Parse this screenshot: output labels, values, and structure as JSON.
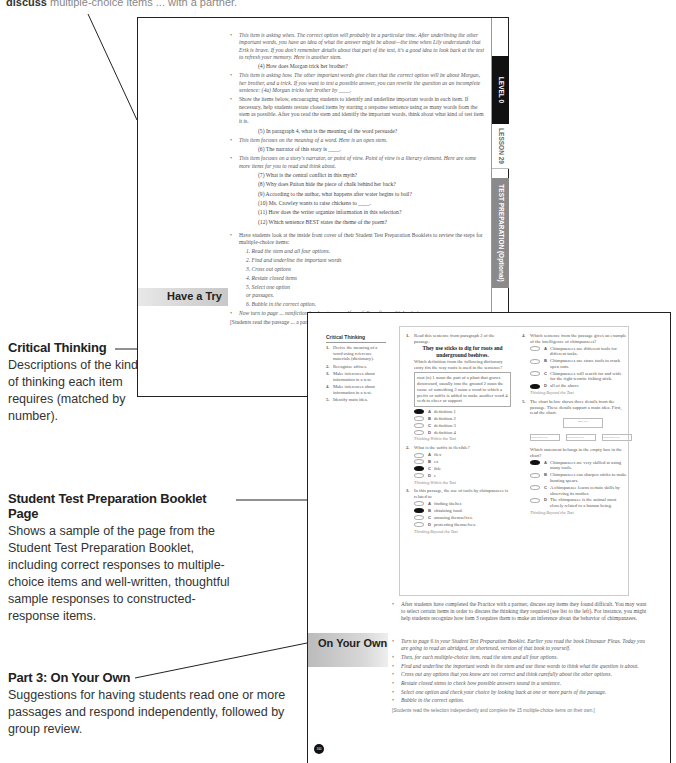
{
  "top_fragment": {
    "bold": "discuss",
    "rest": "multiple-choice items ... with a partner."
  },
  "callouts": {
    "critical_thinking": {
      "title": "Critical Thinking",
      "body": "Descriptions of the kind of thinking each item requires (matched by number)."
    },
    "booklet_page": {
      "title": "Student Test Preparation Booklet Page",
      "body": "Shows a sample of the page from the Student Test Preparation Booklet, including correct responses to multiple-choice items and well-written, thoughtful sample responses to constructed-response items."
    },
    "on_your_own": {
      "title": "Part 3: On Your Own",
      "body": "Suggestions for having students read one or more passages and respond independently, followed by group review."
    }
  },
  "back_page": {
    "tabs": {
      "level": "LEVEL  0",
      "lesson": "LESSON  29",
      "test_prep": "TEST PREPARATION (Optional)"
    },
    "section_label": "Have a Try",
    "bullet1": "This item is asking when. The correct option will probably be a particular time. After underlining the other important words, you have an idea of what the answer might be about—the time when Lily understands that Erik is brave. If you don't remember details about that part of the text, it's a good idea to look back at the text to refresh your memory. Here is another stem.",
    "stem4": "(4)  How does Morgan trick her brother?",
    "bullet2": "This item is asking how. The other important words give clues that the correct option will be about Morgan, her brother, and a trick. If you want to test a possible answer, you can rewrite the question as an incomplete sentence: (4a) Morgan tricks her brother by ____.",
    "bullet3": "Show the items below, encouraging students to identify and underline important words in each item. If necessary, help students restate closed items by starting a response sentence using as many words from the stem as possible. After you read the stem and identify the important words, think about what kind of test item it is.",
    "stem5": "(5)  In paragraph 4, what is the meaning of the word persuade?",
    "bullet4": "This item focuses on the meaning of a word. Here is an open stem.",
    "stem6": "(6)  The narrator of this story is ____.",
    "bullet5": "This item focuses on a story's narrator, or point of view. Point of view is a literary element. Here are some more items for you to read and think about.",
    "stems": [
      "(7)  What is the central conflict in this myth?",
      "(8)  Why does Paiton hide the piece of chalk behind her back?",
      "(9)  According to the author, what happens after water begins to boil?",
      "(10)  Ms. Crowley wants to raise chickens to ____.",
      "(11)  How does the writer organize information in this selection?",
      "(12)  Which sentence BEST states the theme of the poem?"
    ],
    "bullet6": "Have students look at the inside front cover of their Student Test Preparation Booklets to review the steps for multiple-choice items:",
    "steps": [
      "1. Read the stem and all four options.",
      "2. Find and underline the important words",
      "3. Cross out options",
      "4. Restate closed items",
      "5. Select one option",
      "or passages.",
      "6. Bubble in the correct option."
    ],
    "bullet7": "Now turn to page ... nonfiction book ... to yourself carefully ... five multiple-choice",
    "note": "[Students read the passage ... a partner.]"
  },
  "front_page": {
    "critical_thinking": {
      "title": "Critical Thinking",
      "items": [
        {
          "n": "1.",
          "text": "Derive the meaning of a word using reference materials (dictionary)."
        },
        {
          "n": "2.",
          "text": "Recognize affixes."
        },
        {
          "n": "3.",
          "text": "Make inferences about information in a text."
        },
        {
          "n": "4.",
          "text": "Make inferences about information in a text."
        },
        {
          "n": "5.",
          "text": "Identify main idea."
        }
      ]
    },
    "booklet": {
      "q1": {
        "n": "1.",
        "prompt": "Read this sentence from paragraph 2 of the passage.",
        "sentence": "They use sticks to dig for roots and underground beehives.",
        "question": "Which definition from the following dictionary entry fits the way roots is used in the sentence?",
        "definition": "root (n) 1 noun the part of a plant that grows downward, usually into the ground 2 noun the cause of something 3 noun a word to which a prefix or suffix is added to make another word 4 verb to cheer or support",
        "options": [
          {
            "letter": "A",
            "text": "definition 1",
            "selected": true
          },
          {
            "letter": "B",
            "text": "definition 2",
            "selected": false
          },
          {
            "letter": "C",
            "text": "definition 3",
            "selected": false
          },
          {
            "letter": "D",
            "text": "definition 4",
            "selected": false
          }
        ],
        "thinking": "Thinking Within the Text"
      },
      "q2": {
        "n": "2.",
        "question": "What is the suffix in flexible?",
        "options": [
          {
            "letter": "A",
            "text": "flex",
            "selected": false
          },
          {
            "letter": "B",
            "text": "ex",
            "selected": false
          },
          {
            "letter": "C",
            "text": "ible",
            "selected": true
          },
          {
            "letter": "D",
            "text": "e",
            "selected": false
          }
        ],
        "thinking": "Thinking Within the Text"
      },
      "q3": {
        "n": "3.",
        "question": "In this passage, the use of tools by chimpanzees is related to",
        "options": [
          {
            "letter": "A",
            "text": "finding shelter.",
            "selected": false
          },
          {
            "letter": "B",
            "text": "obtaining food.",
            "selected": true
          },
          {
            "letter": "C",
            "text": "amusing themselves.",
            "selected": false
          },
          {
            "letter": "D",
            "text": "protecting themselves.",
            "selected": false
          }
        ],
        "thinking": "Thinking Beyond the Text"
      },
      "q4": {
        "n": "4.",
        "question": "Which sentence from the passage gives an example of the intelligence of chimpanzees?",
        "options": [
          {
            "letter": "A",
            "text": "Chimpanzees use different tools for different tasks.",
            "selected": false
          },
          {
            "letter": "B",
            "text": "Chimpanzees use stone tools to crack open nuts.",
            "selected": false
          },
          {
            "letter": "C",
            "text": "Chimpanzees will search far and wide for the right termite fishing stick.",
            "selected": false
          },
          {
            "letter": "D",
            "text": "all of the above",
            "selected": true
          }
        ],
        "thinking": "Thinking Beyond the Text"
      },
      "q5": {
        "n": "5.",
        "prompt": "The chart below shows three details from the passage. These details support a main idea. First, read the chart.",
        "chart": {
          "main_idea": "main idea",
          "details": [
            "Supporting Detail",
            "Supporting Detail",
            "Supporting Detail"
          ]
        },
        "question": "Which statement belongs in the empty box in the chart?",
        "options": [
          {
            "letter": "A",
            "text": "Chimpanzees are very skilled at using many tools.",
            "selected": true
          },
          {
            "letter": "B",
            "text": "Chimpanzees can sharpen sticks to make hunting spears.",
            "selected": false
          },
          {
            "letter": "C",
            "text": "A chimpanzee learns certain skills by observing its mother.",
            "selected": false
          },
          {
            "letter": "D",
            "text": "The chimpanzee is the animal most closely related to a human being.",
            "selected": false
          }
        ],
        "thinking": "Thinking Beyond the Text"
      }
    },
    "after_bullet": "After students have completed the Practice with a partner, discuss any items they found difficult. You may want to select certain items in order to discuss the thinking they required (see list to the left). For instance, you might help students recognize how item 3 requires them to make an inference about the behavior of chimpanzees.",
    "section_label": "On Your Own",
    "oyo_bullets": [
      "Turn to page 6 in your Student Test Preparation Booklet. Earlier you read the book Dinosaur Fleas. Today you are going to read an abridged, or shortened, version of that book to yourself.",
      "Then, for each multiple-choice item, read the stem and all four options.",
      "Find and underline the important words in the stem and use these words to think what the question is about.",
      "Cross out any options that you know are not correct and think carefully about the other options.",
      "Restate closed stems to check how possible answers sound in a sentence.",
      "Select one option and check your choice by looking back at one or more parts of the passage.",
      "Bubble in the correct option."
    ],
    "oyo_note": "[Students read the selection independently and complete the 15 multiple-choice items on their own.]",
    "page_number": "160"
  }
}
